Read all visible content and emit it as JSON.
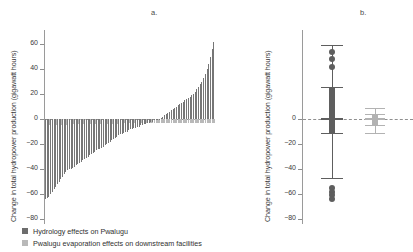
{
  "figure": {
    "panels": [
      {
        "label": "a.",
        "type": "bar"
      },
      {
        "label": "b.",
        "type": "box"
      }
    ],
    "axis_title": "Change in total hydropower production (gigawatt hours)",
    "tick_labels": [
      "60",
      "40",
      "20",
      "0",
      "−20",
      "−40",
      "−60",
      "−80"
    ]
  },
  "legend": {
    "items": [
      {
        "label": "Hydrology effects on Pwalugu",
        "color": "#6d6d6d",
        "swatch": "dark"
      },
      {
        "label": "Pwalugu evaporation effects on downstream facilities",
        "color": "#b9b9b9",
        "swatch": "light"
      }
    ]
  },
  "chart_data": [
    {
      "type": "bar",
      "title": "a.",
      "xlabel": "",
      "ylabel": "Change in total hydropower production (gigawatt hours)",
      "ylim": [
        -88,
        70
      ],
      "yticks": [
        60,
        40,
        20,
        0,
        -20,
        -40,
        -60,
        -80
      ],
      "grid": false,
      "legend_position": "below",
      "note": "Sorted waterfall of per-scenario changes; dark bars = hydrology effects on Pwalugu, light bars = Pwalugu evaporation effects on downstream facilities",
      "series": [
        {
          "name": "Hydrology effects on Pwalugu",
          "color": "#767676",
          "values": [
            -64,
            -63,
            -62,
            -60,
            -58,
            -56,
            -54,
            -52,
            -50,
            -48,
            -46,
            -44,
            -42,
            -41,
            -40,
            -40,
            -39,
            -38,
            -37,
            -36,
            -35,
            -34,
            -33,
            -32,
            -31,
            -30,
            -29,
            -28,
            -27,
            -26,
            -25,
            -24,
            -24,
            -23,
            -22,
            -21,
            -20,
            -19,
            -18,
            -17,
            -16,
            -15,
            -14,
            -13,
            -12,
            -12,
            -11,
            -10,
            -10,
            -9,
            -8,
            -8,
            -7,
            -7,
            -6,
            -6,
            -5,
            -5,
            -4,
            -4,
            -3,
            -3,
            -2,
            -2,
            -1,
            -1,
            -1,
            0,
            1,
            2,
            3,
            4,
            5,
            6,
            7,
            8,
            9,
            10,
            11,
            12,
            13,
            14,
            15,
            16,
            17,
            18,
            19,
            20,
            22,
            24,
            26,
            28,
            30,
            33,
            36,
            40,
            44,
            50,
            56,
            62
          ]
        },
        {
          "name": "Pwalugu evaporation effects on downstream facilities",
          "color": "#b9b9b9",
          "values": [
            -5,
            -5,
            -5,
            -5,
            -5,
            -5,
            -5,
            -5,
            -5,
            -5,
            -5,
            -5,
            -5,
            -4,
            -4,
            -4,
            -4,
            -4,
            -4,
            -4,
            -4,
            -4,
            -4,
            -4,
            -4,
            -4,
            -4,
            -4,
            -4,
            -4,
            -4,
            -4,
            -4,
            -4,
            -4,
            -4,
            -4,
            -4,
            -4,
            -4,
            -4,
            -4,
            -4,
            -3,
            -3,
            -3,
            -3,
            -3,
            -3,
            -3,
            -3,
            -3,
            -3,
            -3,
            -3,
            -3,
            -3,
            -3,
            -3,
            -3,
            -3,
            -3,
            -3,
            -3,
            -3,
            -3,
            -3,
            -3,
            -3,
            -3,
            -3,
            -3,
            -3,
            -3,
            -3,
            -3,
            -3,
            -3,
            -3,
            -3,
            -3,
            -3,
            -3,
            -3,
            -3,
            -3,
            -3,
            -3,
            -3,
            -3,
            -3,
            -3,
            -3,
            -3,
            -3,
            -3,
            -3,
            -3,
            -3,
            -3
          ]
        }
      ]
    },
    {
      "type": "box",
      "title": "b.",
      "xlabel": "",
      "ylabel": "Change in total hydropower production (gigawatt hours)",
      "ylim": [
        -88,
        70
      ],
      "yticks": [
        60,
        40,
        20,
        0,
        -20,
        -40,
        -60,
        -80
      ],
      "grid": false,
      "boxes": [
        {
          "name": "Hydrology effects on Pwalugu",
          "color": "#5e5e5e",
          "whisker_high": 59,
          "q3": 26,
          "median": 0,
          "q1": -11,
          "whisker_low": -47,
          "outliers_high": [
            54,
            48,
            42
          ],
          "outliers_low": [
            -55,
            -58,
            -61,
            -64
          ]
        },
        {
          "name": "Pwalugu evaporation effects on downstream facilities",
          "color": "#b2b2b2",
          "whisker_high": 9,
          "q3": 4,
          "median": 0,
          "q1": -5,
          "whisker_low": -11,
          "outliers_high": [],
          "outliers_low": []
        }
      ]
    }
  ]
}
